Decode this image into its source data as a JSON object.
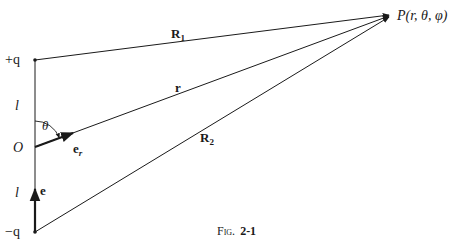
{
  "figure": {
    "caption_prefix": "Fig.",
    "caption_number": "2-1",
    "points": {
      "plus_q": "+q",
      "origin": "O",
      "minus_q": "−q",
      "P": "P(r, θ, φ)"
    },
    "segment_labels": {
      "upper_l": "l",
      "lower_l": "l",
      "theta": "θ"
    },
    "vectors": {
      "R1": "R",
      "R1_sub": "1",
      "r": "r",
      "R2": "R",
      "R2_sub": "2",
      "e_r": "e",
      "e_r_sub": "r",
      "e": "e"
    },
    "colors": {
      "line": "#1a1a1a",
      "background": "#ffffff"
    }
  }
}
